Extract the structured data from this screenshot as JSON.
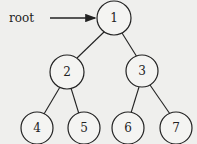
{
  "diagram": {
    "type": "binary-tree",
    "pointer_label": "root",
    "nodes": [
      {
        "id": "1",
        "label": "1"
      },
      {
        "id": "2",
        "label": "2"
      },
      {
        "id": "3",
        "label": "3"
      },
      {
        "id": "4",
        "label": "4"
      },
      {
        "id": "5",
        "label": "5"
      },
      {
        "id": "6",
        "label": "6"
      },
      {
        "id": "7",
        "label": "7"
      }
    ],
    "edges": [
      {
        "from": "1",
        "to": "2"
      },
      {
        "from": "1",
        "to": "3"
      },
      {
        "from": "2",
        "to": "4"
      },
      {
        "from": "2",
        "to": "5"
      },
      {
        "from": "3",
        "to": "6"
      },
      {
        "from": "3",
        "to": "7"
      }
    ]
  }
}
